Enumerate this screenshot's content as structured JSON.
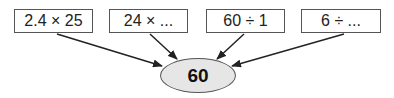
{
  "diagram": {
    "boxes": [
      {
        "label": "2.4 × 25"
      },
      {
        "label": "24 × ..."
      },
      {
        "label": "60 ÷ 1"
      },
      {
        "label": "6 ÷ ..."
      }
    ],
    "target": {
      "label": "60"
    },
    "colors": {
      "ellipse_fill": "#e6e6e6",
      "stroke": "#222222"
    }
  }
}
